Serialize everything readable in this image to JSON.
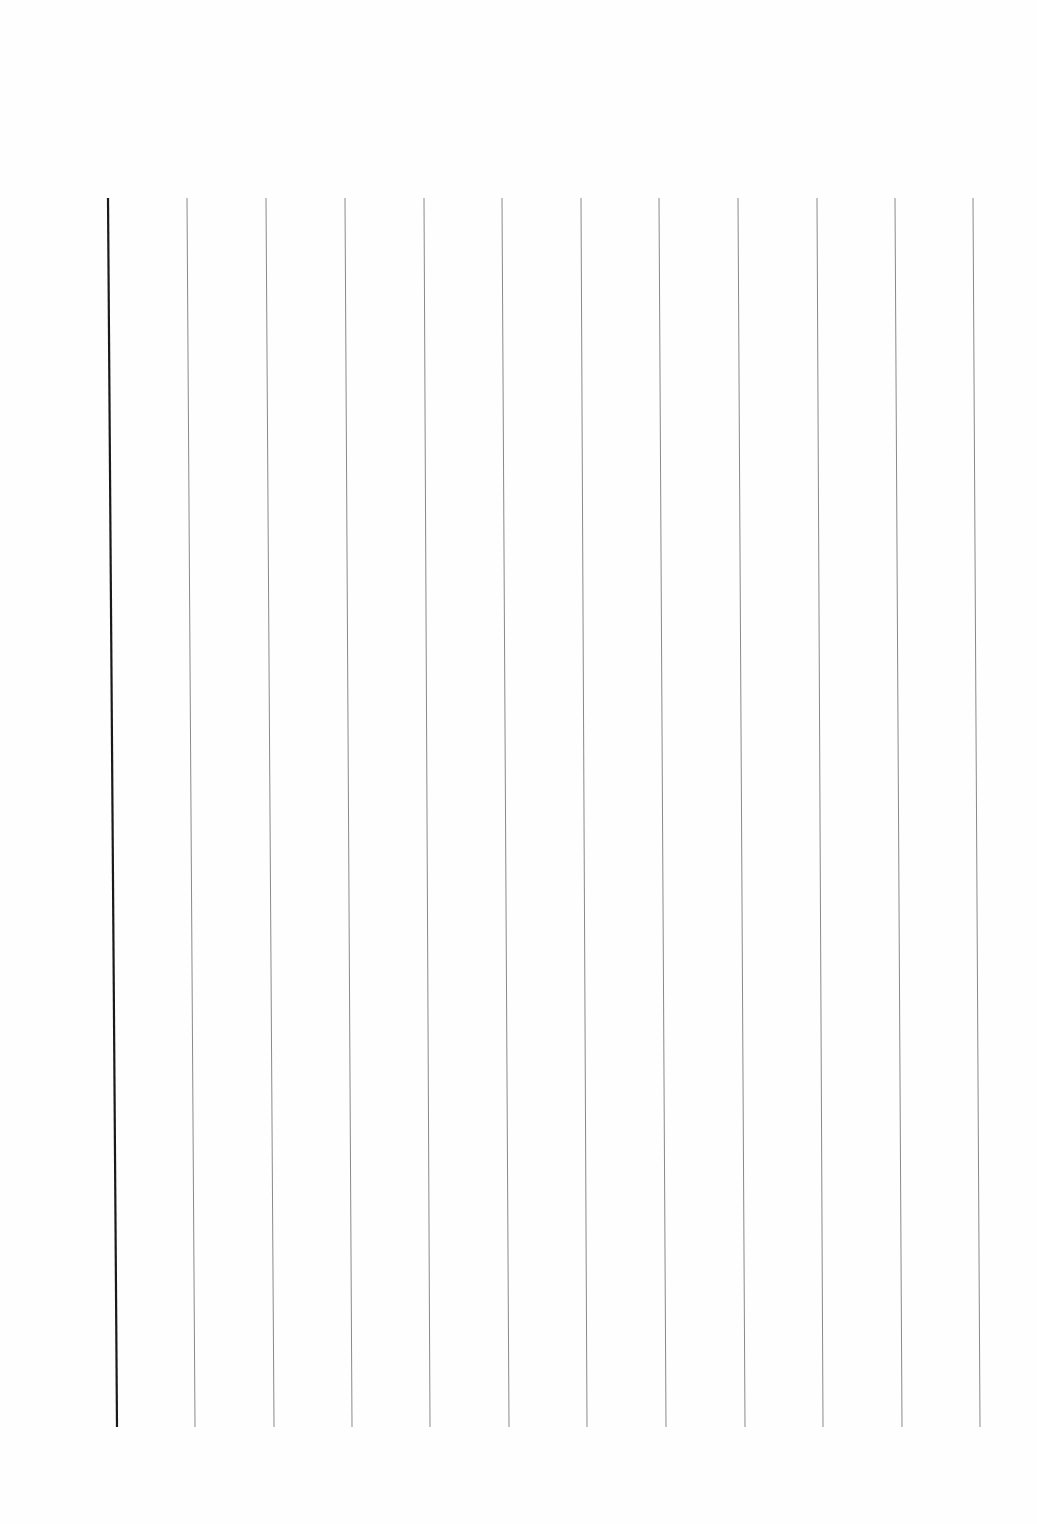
{
  "page": {
    "type": "ruled-sheet",
    "background": "#fefefe",
    "line_top_y": 198,
    "line_bottom_y": 1427,
    "lines": [
      {
        "x_top": 108,
        "x_bottom": 117,
        "color": "#1a1a1a",
        "width": 2.2,
        "kind": "margin"
      },
      {
        "x_top": 187,
        "x_bottom": 195,
        "color": "#8a8a8a",
        "width": 1
      },
      {
        "x_top": 266,
        "x_bottom": 274,
        "color": "#8a8a8a",
        "width": 1
      },
      {
        "x_top": 345,
        "x_bottom": 352,
        "color": "#8a8a8a",
        "width": 1
      },
      {
        "x_top": 424,
        "x_bottom": 430,
        "color": "#8a8a8a",
        "width": 1
      },
      {
        "x_top": 502,
        "x_bottom": 509,
        "color": "#8a8a8a",
        "width": 1
      },
      {
        "x_top": 581,
        "x_bottom": 587,
        "color": "#8a8a8a",
        "width": 1
      },
      {
        "x_top": 659,
        "x_bottom": 666,
        "color": "#8a8a8a",
        "width": 1
      },
      {
        "x_top": 738,
        "x_bottom": 745,
        "color": "#8a8a8a",
        "width": 1
      },
      {
        "x_top": 817,
        "x_bottom": 823,
        "color": "#8a8a8a",
        "width": 1
      },
      {
        "x_top": 895,
        "x_bottom": 902,
        "color": "#8a8a8a",
        "width": 1
      },
      {
        "x_top": 973,
        "x_bottom": 980,
        "color": "#8a8a8a",
        "width": 1
      }
    ]
  }
}
